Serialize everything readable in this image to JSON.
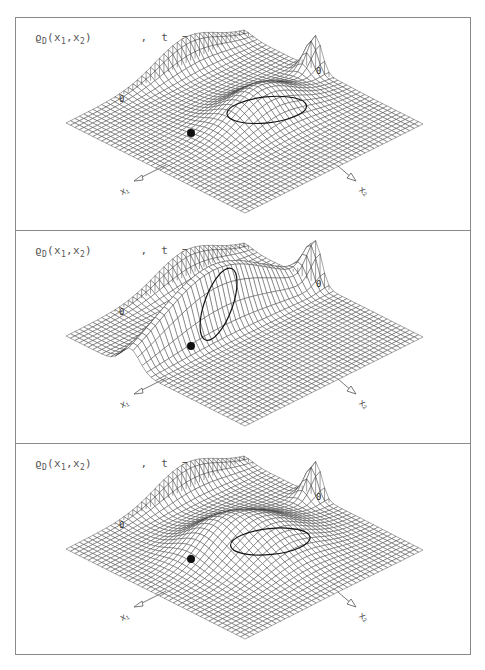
{
  "figure": {
    "panel_count": 3,
    "line_color": "#3a3a3a",
    "border_color": "#8a8a8a",
    "grid_resolution": 40,
    "panels": [
      {
        "title": {
          "func": "ϱ",
          "func_sub": "D",
          "args": "(x",
          "arg1_sub": "1",
          "sep": ",x",
          "arg2_sub": "2",
          "close": ")",
          "comma": ",",
          "time_var": "t",
          "eq": "=",
          "time_val": "t",
          "time_sub": "0"
        },
        "axes": {
          "x1": "x₁",
          "x2": "x₂"
        },
        "marker_zero_left": "0",
        "marker_zero_right": "0",
        "central_bump": {
          "u": 0.5,
          "v": 0.42,
          "su": 0.1,
          "sv": 0.16,
          "amp": 30,
          "type": "gauss"
        }
      },
      {
        "title": {
          "func": "ϱ",
          "func_sub": "D",
          "args": "(x",
          "arg1_sub": "1",
          "sep": ",x",
          "arg2_sub": "2",
          "close": ")",
          "comma": ",",
          "time_var": "t",
          "eq": "=",
          "time_val": "t",
          "time_sub": "0"
        },
        "axes": {
          "x1": "x₁",
          "x2": "x₂"
        },
        "marker_zero_left": "0",
        "marker_zero_right": "0",
        "central_bump": {
          "u": 0.36,
          "v": 0.55,
          "su": 0.05,
          "sv": 0.3,
          "amp": 62,
          "type": "ridge"
        }
      },
      {
        "title": {
          "func": "ϱ",
          "func_sub": "D",
          "args": "(x",
          "arg1_sub": "1",
          "sep": ",x",
          "arg2_sub": "2",
          "close": ")",
          "comma": ",",
          "time_var": "t",
          "eq": "=",
          "time_val": "t",
          "time_sub": "0"
        },
        "axes": {
          "x1": "x₁",
          "x2": "x₂"
        },
        "marker_zero_left": "0",
        "marker_zero_right": "0",
        "central_bump": {
          "u": 0.55,
          "v": 0.45,
          "su": 0.16,
          "sv": 0.16,
          "amp": 30,
          "type": "wide"
        }
      }
    ]
  }
}
